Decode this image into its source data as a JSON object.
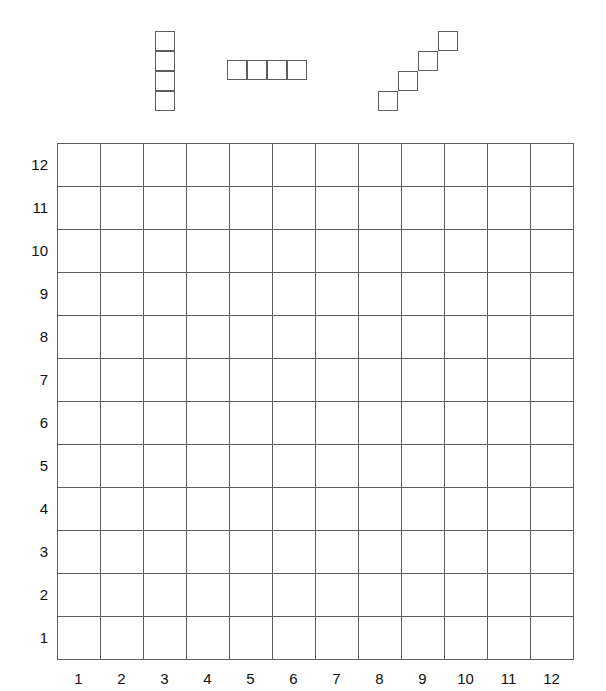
{
  "canvas": {
    "width": 606,
    "height": 691,
    "background": "#fefefe",
    "line_color": "#5d5d5d",
    "text_color": "#101010"
  },
  "pieces": {
    "title": "tetromino-pieces",
    "cell_size": 20,
    "items": [
      {
        "name": "vertical-i-piece",
        "label": "I",
        "origin_x": 155,
        "origin_y": 31,
        "cells": [
          [
            0,
            0
          ],
          [
            0,
            1
          ],
          [
            0,
            2
          ],
          [
            0,
            3
          ]
        ]
      },
      {
        "name": "horizontal-i-piece",
        "label": "I",
        "origin_x": 227,
        "origin_y": 60,
        "cells": [
          [
            0,
            0
          ],
          [
            1,
            0
          ],
          [
            2,
            0
          ],
          [
            3,
            0
          ]
        ]
      },
      {
        "name": "diagonal-staircase-piece",
        "label": "W",
        "origin_x": 378,
        "origin_y": 31,
        "cells": [
          [
            0,
            3
          ],
          [
            1,
            2
          ],
          [
            2,
            1
          ],
          [
            3,
            0
          ]
        ]
      }
    ]
  },
  "grid": {
    "name": "coordinate-grid",
    "columns": 12,
    "rows": 12,
    "origin_x": 57,
    "origin_y": 143,
    "cell_size": 43,
    "row_labels": [
      "12",
      "11",
      "10",
      "9",
      "8",
      "7",
      "6",
      "5",
      "4",
      "3",
      "2",
      "1"
    ],
    "col_labels": [
      "1",
      "2",
      "3",
      "4",
      "5",
      "6",
      "7",
      "8",
      "9",
      "10",
      "11",
      "12"
    ]
  }
}
